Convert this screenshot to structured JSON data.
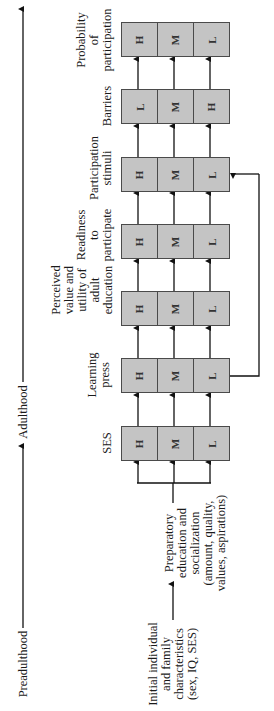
{
  "timeline": {
    "stages": [
      {
        "label": "Preadulthood"
      },
      {
        "label": "Adulthood"
      }
    ]
  },
  "inputs": {
    "initial": "Initial individual|and family|characteristics|(sex, IQ, SES)",
    "preparatory": "Preparatory|education and|socialization|(amount, quality,|values, aspirations)"
  },
  "stages": [
    {
      "id": "ses",
      "label": "SES",
      "cells": [
        "H",
        "M",
        "L"
      ]
    },
    {
      "id": "learning-press",
      "label": "Learning|press",
      "cells": [
        "H",
        "M",
        "L"
      ]
    },
    {
      "id": "perceived-value",
      "label": "Perceived|value and|utility of|adult|education",
      "cells": [
        "H",
        "M",
        "L"
      ]
    },
    {
      "id": "readiness",
      "label": "Readiness|to|participate",
      "cells": [
        "H",
        "M",
        "L"
      ]
    },
    {
      "id": "participation-stimuli",
      "label": "Participation|stimuli",
      "cells": [
        "H",
        "M",
        "L"
      ]
    },
    {
      "id": "barriers",
      "label": "Barriers",
      "cells": [
        "L",
        "M",
        "H"
      ]
    },
    {
      "id": "probability",
      "label": "Probability|of|participation",
      "cells": [
        "H",
        "M",
        "L"
      ]
    }
  ],
  "feedback": {
    "from": "learning-press",
    "to": "participation-stimuli",
    "level": "L"
  },
  "colors": {
    "box_fill": "#c4c4c4",
    "box_border": "#4a4a4a",
    "line": "#111111"
  }
}
